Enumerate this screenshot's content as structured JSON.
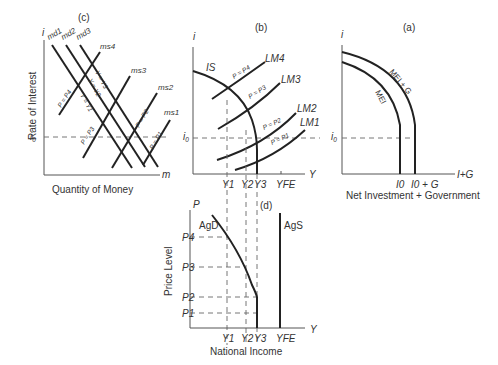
{
  "panels": {
    "c": {
      "tag": "(c)",
      "y_axis": "i",
      "x_axis": "m",
      "y_title": "Rate of Interest",
      "x_title": "Quantity of Money",
      "i0": "i0",
      "demand_curves": [
        "md1",
        "md2",
        "md3"
      ],
      "demand_labels": [
        "Y = Y1",
        "Y = Y2",
        "Y = Y3"
      ],
      "supply_curves": [
        "ms4",
        "ms3",
        "ms2",
        "ms1"
      ],
      "supply_labels": [
        "P = P4",
        "P = P3",
        "P = P2",
        "P = P1"
      ]
    },
    "b": {
      "tag": "(b)",
      "y_axis": "i",
      "x_axis": "Y",
      "i0": "i0",
      "is_label": "IS",
      "lm_curves": [
        "LM4",
        "LM3",
        "LM2",
        "LM1"
      ],
      "lm_labels": [
        "P = P4",
        "P = P3",
        "P = P2",
        "P = P1"
      ],
      "x_ticks": [
        "Y1",
        "Y2",
        "Y3",
        "YFE"
      ]
    },
    "a": {
      "tag": "(a)",
      "y_axis": "i",
      "x_axis": "I+G",
      "i0": "i0",
      "curves": [
        "MEI",
        "MEI + G"
      ],
      "x_ticks": [
        "I0",
        "I0 + G"
      ],
      "x_title": "Net Investment + Government"
    },
    "d": {
      "tag": "(d)",
      "y_axis": "P",
      "x_axis": "Y",
      "y_title": "Price Level",
      "x_title": "National Income",
      "curves": [
        "AgD",
        "AgS"
      ],
      "y_ticks": [
        "P4",
        "P3",
        "P2",
        "P1"
      ],
      "x_ticks": [
        "Y1",
        "Y2",
        "Y3",
        "YFE"
      ]
    }
  }
}
